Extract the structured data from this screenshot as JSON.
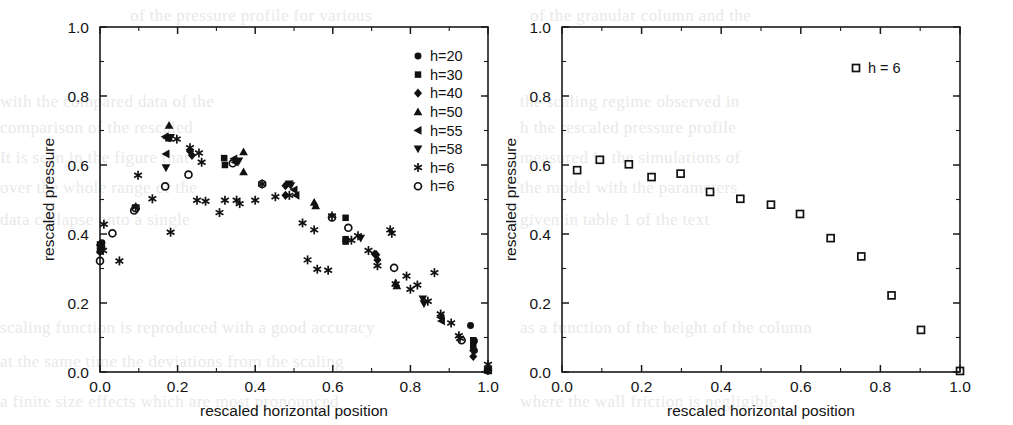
{
  "figure": {
    "panels": [
      {
        "id": "left",
        "xlabel": "rescaled horizontal position",
        "ylabel": "rescaled pressure",
        "xticks": [
          "0.0",
          "0.2",
          "0.4",
          "0.6",
          "0.8",
          "1.0"
        ],
        "yticks": [
          "0.0",
          "0.2",
          "0.4",
          "0.6",
          "0.8",
          "1.0"
        ],
        "legend": [
          {
            "label": "h=20",
            "marker": "filled-circle"
          },
          {
            "label": "h=30",
            "marker": "filled-square"
          },
          {
            "label": "h=40",
            "marker": "filled-diamond"
          },
          {
            "label": "h=50",
            "marker": "filled-triangle-up"
          },
          {
            "label": "h=55",
            "marker": "filled-triangle-left"
          },
          {
            "label": "h=58",
            "marker": "filled-triangle-down"
          },
          {
            "label": "h=6",
            "marker": "asterisk"
          },
          {
            "label": "h=6",
            "marker": "open-circle"
          }
        ]
      },
      {
        "id": "right",
        "xlabel": "rescaled horizontal position",
        "ylabel": "rescaled pressure",
        "xticks": [
          "0.0",
          "0.2",
          "0.4",
          "0.6",
          "0.8",
          "1.0"
        ],
        "yticks": [
          "0.0",
          "0.2",
          "0.4",
          "0.6",
          "0.8",
          "1.0"
        ],
        "legend": [
          {
            "label": "h = 6",
            "marker": "open-square"
          }
        ]
      }
    ],
    "ghost_text": [
      {
        "x": 130,
        "y": 6,
        "text": "of the pressure profile for various"
      },
      {
        "x": 0,
        "y": 92,
        "text": "with the  compared  data of the"
      },
      {
        "x": 0,
        "y": 118,
        "text": "comparison  of  the  rescaled"
      },
      {
        "x": 0,
        "y": 148,
        "text": "It  is  seen  in  the  figure  that"
      },
      {
        "x": 0,
        "y": 178,
        "text": "over  the  whole  range  of  the"
      },
      {
        "x": 0,
        "y": 210,
        "text": "data  collapse  onto  a  single"
      },
      {
        "x": 0,
        "y": 318,
        "text": "scaling  function  is  reproduced  with  a  good  accuracy"
      },
      {
        "x": 0,
        "y": 352,
        "text": "at  the  same  time  the  deviations  from  the  scaling"
      },
      {
        "x": 0,
        "y": 392,
        "text": "a  finite  size  effects  which  are  most  pronounced"
      },
      {
        "x": 530,
        "y": 6,
        "text": "of  the  granular  column  and  the"
      },
      {
        "x": 520,
        "y": 92,
        "text": "the  scaling  regime  observed  in"
      },
      {
        "x": 520,
        "y": 118,
        "text": "h  the  rescaled  pressure  profile"
      },
      {
        "x": 520,
        "y": 148,
        "text": "measured  in  the  simulations  of"
      },
      {
        "x": 520,
        "y": 178,
        "text": "the  model  with  the  parameters"
      },
      {
        "x": 520,
        "y": 210,
        "text": "given  in  table  1  of  the  text"
      },
      {
        "x": 520,
        "y": 318,
        "text": "as  a  function  of  the  height  of  the  column"
      },
      {
        "x": 520,
        "y": 392,
        "text": "where  the  wall  friction  is  negligible"
      }
    ]
  },
  "chart_data": [
    {
      "type": "scatter",
      "panel": "left",
      "title": "",
      "xlabel": "rescaled horizontal position",
      "ylabel": "rescaled pressure",
      "xlim": [
        0.0,
        1.0
      ],
      "ylim": [
        0.0,
        1.0
      ],
      "grid": false,
      "legend_position": "top-right",
      "series": [
        {
          "name": "h=20",
          "marker": "filled-circle",
          "points": [
            [
              0.005,
              0.375
            ],
            [
              0.005,
              0.362
            ],
            [
              0.955,
              0.135
            ],
            [
              0.965,
              0.09
            ],
            [
              0.965,
              0.062
            ],
            [
              1.0,
              0.005
            ]
          ]
        },
        {
          "name": "h=30",
          "marker": "filled-square",
          "points": [
            [
              0.0,
              0.37
            ],
            [
              0.0,
              0.352
            ],
            [
              0.32,
              0.62
            ],
            [
              0.322,
              0.6
            ],
            [
              0.633,
              0.447
            ],
            [
              0.633,
              0.385
            ],
            [
              0.633,
              0.378
            ],
            [
              0.962,
              0.092
            ],
            [
              0.962,
              0.075
            ],
            [
              1.0,
              0.005
            ]
          ]
        },
        {
          "name": "h=40",
          "marker": "filled-diamond",
          "points": [
            [
              0.0,
              0.368
            ],
            [
              0.0,
              0.348
            ],
            [
              0.232,
              0.64
            ],
            [
              0.237,
              0.628
            ],
            [
              0.478,
              0.54
            ],
            [
              0.478,
              0.512
            ],
            [
              0.708,
              0.342
            ],
            [
              0.712,
              0.34
            ],
            [
              0.715,
              0.325
            ],
            [
              0.962,
              0.062
            ],
            [
              0.962,
              0.045
            ],
            [
              1.0,
              0.005
            ]
          ]
        },
        {
          "name": "h=50",
          "marker": "filled-triangle-up",
          "points": [
            [
              0.178,
              0.715
            ],
            [
              0.178,
              0.678
            ],
            [
              0.37,
              0.638
            ],
            [
              0.37,
              0.58
            ],
            [
              0.552,
              0.492
            ],
            [
              0.556,
              0.482
            ],
            [
              0.762,
              0.258
            ],
            [
              0.765,
              0.25
            ],
            [
              1.0,
              0.005
            ]
          ]
        },
        {
          "name": "h=55",
          "marker": "filled-triangle-left",
          "points": [
            [
              0.168,
              0.682
            ],
            [
              0.172,
              0.678
            ],
            [
              0.17,
              0.632
            ],
            [
              0.345,
              0.618
            ],
            [
              0.348,
              0.608
            ],
            [
              0.5,
              0.528
            ],
            [
              0.505,
              0.512
            ],
            [
              0.878,
              0.158
            ],
            [
              0.88,
              0.148
            ],
            [
              1.0,
              0.005
            ]
          ]
        },
        {
          "name": "h=58",
          "marker": "filled-triangle-down",
          "points": [
            [
              0.182,
              0.68
            ],
            [
              0.17,
              0.592
            ],
            [
              0.358,
              0.612
            ],
            [
              0.488,
              0.545
            ],
            [
              0.492,
              0.54
            ],
            [
              0.672,
              0.388
            ],
            [
              0.832,
              0.212
            ],
            [
              0.835,
              0.198
            ],
            [
              1.0,
              0.005
            ]
          ]
        },
        {
          "name": "h=6",
          "marker": "asterisk",
          "points": [
            [
              0.01,
              0.428
            ],
            [
              0.008,
              0.352
            ],
            [
              0.05,
              0.322
            ],
            [
              0.092,
              0.478
            ],
            [
              0.098,
              0.57
            ],
            [
              0.135,
              0.502
            ],
            [
              0.182,
              0.405
            ],
            [
              0.198,
              0.675
            ],
            [
              0.232,
              0.65
            ],
            [
              0.255,
              0.635
            ],
            [
              0.262,
              0.608
            ],
            [
              0.25,
              0.498
            ],
            [
              0.272,
              0.495
            ],
            [
              0.308,
              0.462
            ],
            [
              0.322,
              0.498
            ],
            [
              0.352,
              0.498
            ],
            [
              0.36,
              0.488
            ],
            [
              0.4,
              0.498
            ],
            [
              0.418,
              0.545
            ],
            [
              0.452,
              0.508
            ],
            [
              0.488,
              0.512
            ],
            [
              0.522,
              0.432
            ],
            [
              0.535,
              0.325
            ],
            [
              0.552,
              0.412
            ],
            [
              0.56,
              0.298
            ],
            [
              0.588,
              0.295
            ],
            [
              0.598,
              0.452
            ],
            [
              0.648,
              0.382
            ],
            [
              0.665,
              0.395
            ],
            [
              0.692,
              0.352
            ],
            [
              0.715,
              0.308
            ],
            [
              0.748,
              0.412
            ],
            [
              0.752,
              0.402
            ],
            [
              0.762,
              0.255
            ],
            [
              0.79,
              0.278
            ],
            [
              0.8,
              0.24
            ],
            [
              0.818,
              0.252
            ],
            [
              0.845,
              0.205
            ],
            [
              0.862,
              0.288
            ],
            [
              0.878,
              0.168
            ],
            [
              0.905,
              0.142
            ],
            [
              0.925,
              0.105
            ],
            [
              0.928,
              0.098
            ],
            [
              1.0,
              0.022
            ],
            [
              1.0,
              0.005
            ]
          ]
        },
        {
          "name": "h=6",
          "marker": "open-circle",
          "points": [
            [
              0.0,
              0.322
            ],
            [
              0.032,
              0.402
            ],
            [
              0.088,
              0.468
            ],
            [
              0.092,
              0.475
            ],
            [
              0.168,
              0.538
            ],
            [
              0.228,
              0.572
            ],
            [
              0.342,
              0.605
            ],
            [
              0.418,
              0.545
            ],
            [
              0.598,
              0.448
            ],
            [
              0.64,
              0.418
            ],
            [
              0.758,
              0.302
            ],
            [
              0.932,
              0.092
            ],
            [
              1.0,
              0.005
            ]
          ]
        }
      ]
    },
    {
      "type": "scatter",
      "panel": "right",
      "title": "",
      "xlabel": "rescaled horizontal position",
      "ylabel": "rescaled pressure",
      "xlim": [
        0.0,
        1.0
      ],
      "ylim": [
        0.0,
        1.0
      ],
      "grid": false,
      "legend_position": "top-right",
      "series": [
        {
          "name": "h = 6",
          "marker": "open-square",
          "points": [
            [
              0.038,
              0.585
            ],
            [
              0.095,
              0.615
            ],
            [
              0.168,
              0.602
            ],
            [
              0.225,
              0.565
            ],
            [
              0.298,
              0.575
            ],
            [
              0.372,
              0.522
            ],
            [
              0.448,
              0.502
            ],
            [
              0.525,
              0.485
            ],
            [
              0.598,
              0.458
            ],
            [
              0.675,
              0.388
            ],
            [
              0.752,
              0.335
            ],
            [
              0.828,
              0.222
            ],
            [
              0.902,
              0.122
            ],
            [
              1.0,
              0.003
            ]
          ]
        }
      ]
    }
  ]
}
